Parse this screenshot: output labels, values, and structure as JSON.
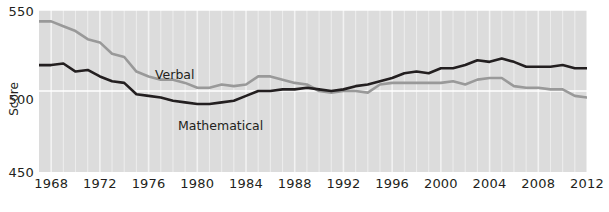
{
  "chart_data": {
    "type": "line",
    "title": "",
    "xlabel": "",
    "ylabel": "Score",
    "xlim": [
      1967,
      2012
    ],
    "ylim": [
      450,
      550
    ],
    "yticks": [
      450,
      500,
      550
    ],
    "xticks": [
      1968,
      1972,
      1976,
      1980,
      1984,
      1988,
      1992,
      1996,
      2000,
      2004,
      2008,
      2012
    ],
    "grid": true,
    "gridlines": "every year (vertical, white); every 50 points (horizontal, white)",
    "legend_position": "inline annotations on series",
    "background": "#dcdcdc",
    "x": [
      1967,
      1968,
      1969,
      1970,
      1971,
      1972,
      1973,
      1974,
      1975,
      1976,
      1977,
      1978,
      1979,
      1980,
      1981,
      1982,
      1983,
      1984,
      1985,
      1986,
      1987,
      1988,
      1989,
      1990,
      1991,
      1992,
      1993,
      1994,
      1995,
      1996,
      1997,
      1998,
      1999,
      2000,
      2001,
      2002,
      2003,
      2004,
      2005,
      2006,
      2007,
      2008,
      2009,
      2010,
      2011,
      2012
    ],
    "series": [
      {
        "name": "Verbal",
        "color": "#999999",
        "values": [
          543,
          543,
          540,
          537,
          532,
          530,
          523,
          521,
          512,
          509,
          507,
          507,
          505,
          502,
          502,
          504,
          503,
          504,
          509,
          509,
          507,
          505,
          504,
          500,
          499,
          500,
          500,
          499,
          504,
          505,
          505,
          505,
          505,
          505,
          506,
          504,
          507,
          508,
          508,
          503,
          502,
          502,
          501,
          501,
          497,
          496
        ]
      },
      {
        "name": "Mathematical",
        "color": "#231f20",
        "values": [
          516,
          516,
          517,
          512,
          513,
          509,
          506,
          505,
          498,
          497,
          496,
          494,
          493,
          492,
          492,
          493,
          494,
          497,
          500,
          500,
          501,
          501,
          502,
          501,
          500,
          501,
          503,
          504,
          506,
          508,
          511,
          512,
          511,
          514,
          514,
          516,
          519,
          518,
          520,
          518,
          515,
          515,
          515,
          516,
          514,
          514
        ]
      }
    ],
    "annotations": [
      {
        "text": "Verbal",
        "x": 1975,
        "y": 520
      },
      {
        "text": "Mathematical",
        "x": 1978,
        "y": 484
      }
    ]
  },
  "axis": {
    "y_title": "Score",
    "y_labels": {
      "top": "550",
      "middle": "500",
      "bottom": "450"
    },
    "x_labels": [
      "1968",
      "1972",
      "1976",
      "1980",
      "1984",
      "1988",
      "1992",
      "1996",
      "2000",
      "2004",
      "2008",
      "2012"
    ]
  },
  "labels": {
    "verbal": "Verbal",
    "mathematical": "Mathematical"
  },
  "colors": {
    "plot_background": "#dcdcdc",
    "gridline": "#f2f2f2",
    "verbal_line": "#999999",
    "mathematical_line": "#231f20",
    "text": "#231f20"
  }
}
